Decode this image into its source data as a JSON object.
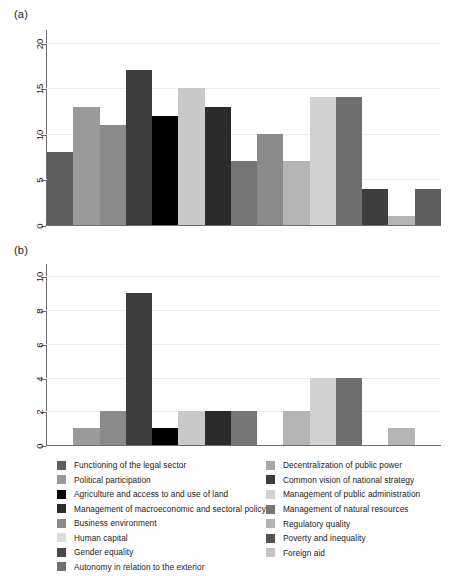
{
  "figure": {
    "panels": [
      {
        "label": "(a)"
      },
      {
        "label": "(b)"
      }
    ]
  },
  "legend": {
    "left_column": [
      {
        "label": "Functioning of the legal sector",
        "color": "#5e5e5e"
      },
      {
        "label": "Political participation",
        "color": "#9a9a9a"
      },
      {
        "label": "Agriculture and access to and use of land",
        "color": "#000000"
      },
      {
        "label": "Management of macroeconomic and sectoral policy",
        "color": "#2b2b2b"
      },
      {
        "label": "Business environment",
        "color": "#8a8a8a"
      },
      {
        "label": "Human capital",
        "color": "#dcdcdc"
      },
      {
        "label": "Gender equality",
        "color": "#4a4a4a"
      },
      {
        "label": "Autonomy in relation to the exterior",
        "color": "#6f6f6f"
      }
    ],
    "right_column": [
      {
        "label": "Decentralization of public power",
        "color": "#a8a8a8"
      },
      {
        "label": "Common vision of national strategy",
        "color": "#3d3d3d"
      },
      {
        "label": "Management of public administration",
        "color": "#d2d2d2"
      },
      {
        "label": "Management of natural resources",
        "color": "#767676"
      },
      {
        "label": "Regulatory quality",
        "color": "#b4b4b4"
      },
      {
        "label": "Poverty and inequality",
        "color": "#525252"
      },
      {
        "label": "Foreign aid",
        "color": "#c4c4c4"
      }
    ]
  },
  "chart_data": [
    {
      "type": "bar",
      "panel": "(a)",
      "title": "",
      "xlabel": "",
      "ylabel": "",
      "ylim": [
        0,
        21.5
      ],
      "yticks": [
        0,
        5,
        10,
        15,
        20
      ],
      "ytick_labels": [
        "0",
        "5",
        "10",
        "15",
        "20"
      ],
      "grid": true,
      "grid_axis": "y",
      "legend_position": "below",
      "categories": [
        "Functioning of the legal sector",
        "Political participation",
        "Decentralization of public power",
        "Common vision of national strategy",
        "Agriculture and access to and use of land",
        "Management of public administration",
        "Management of macroeconomic and sectoral policy",
        "Business environment",
        "Management of natural resources",
        "Regulatory quality",
        "Human capital",
        "Poverty and inequality",
        "Gender equality",
        "Foreign aid",
        "Autonomy in relation to the exterior"
      ],
      "values": [
        8,
        13,
        11,
        17,
        12,
        15,
        13,
        7,
        10,
        7,
        14,
        14,
        4,
        1,
        4
      ],
      "colors": [
        "#5e5e5e",
        "#9a9a9a",
        "#8a8a8a",
        "#3d3d3d",
        "#000000",
        "#c8c8c8",
        "#2b2b2b",
        "#767676",
        "#8a8a8a",
        "#b4b4b4",
        "#d2d2d2",
        "#6f6f6f",
        "#3d3d3d",
        "#b4b4b4",
        "#5e5e5e"
      ]
    },
    {
      "type": "bar",
      "panel": "(b)",
      "title": "",
      "xlabel": "",
      "ylabel": "",
      "ylim": [
        0,
        10.8
      ],
      "yticks": [
        0,
        2,
        4,
        6,
        8,
        10
      ],
      "ytick_labels": [
        "0",
        "2",
        "4",
        "6",
        "8",
        "10"
      ],
      "grid": true,
      "grid_axis": "y",
      "legend_position": "below",
      "categories": [
        "Functioning of the legal sector",
        "Political participation",
        "Decentralization of public power",
        "Common vision of national strategy",
        "Agriculture and access to and use of land",
        "Management of public administration",
        "Management of macroeconomic and sectoral policy",
        "Business environment",
        "Management of natural resources",
        "Regulatory quality",
        "Human capital",
        "Poverty and inequality",
        "Gender equality",
        "Foreign aid",
        "Autonomy in relation to the exterior"
      ],
      "values": [
        0,
        1,
        2,
        9,
        1,
        2,
        2,
        2,
        0,
        2,
        4,
        4,
        0,
        1,
        0
      ],
      "colors": [
        "#5e5e5e",
        "#9a9a9a",
        "#8a8a8a",
        "#3d3d3d",
        "#000000",
        "#c8c8c8",
        "#2b2b2b",
        "#767676",
        "#8a8a8a",
        "#b4b4b4",
        "#d2d2d2",
        "#6f6f6f",
        "#3d3d3d",
        "#b4b4b4",
        "#5e5e5e"
      ]
    }
  ]
}
